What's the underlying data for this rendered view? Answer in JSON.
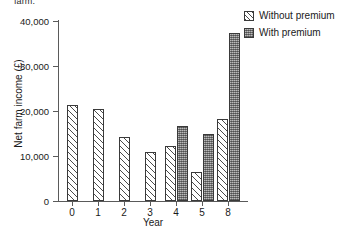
{
  "page": {
    "truncated_caption_above": "farm."
  },
  "chart_data": {
    "type": "bar",
    "title": "",
    "xlabel": "Year",
    "ylabel": "Net farm income (£)",
    "categories": [
      "0",
      "1",
      "2",
      "3",
      "4",
      "5",
      "8"
    ],
    "series": [
      {
        "name": "Without premium",
        "fill": "diagonal-hatch",
        "values": [
          21300,
          20400,
          14200,
          10900,
          12200,
          6400,
          18200
        ]
      },
      {
        "name": "With premium",
        "fill": "dark-checker",
        "values": [
          null,
          null,
          null,
          null,
          16700,
          14800,
          37400
        ]
      }
    ],
    "ylim": [
      0,
      40000
    ],
    "yticks": [
      0,
      10000,
      20000,
      30000,
      40000
    ],
    "ytick_labels": [
      "0",
      "10,000",
      "20,000",
      "30,000",
      "40,000"
    ],
    "grid": false,
    "legend": {
      "position": "top-right",
      "entries": [
        "Without premium",
        "With premium"
      ]
    }
  }
}
